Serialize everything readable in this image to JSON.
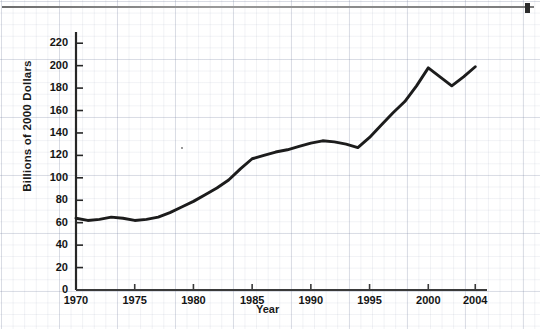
{
  "figure": {
    "ylabel": "Billions of 2000 Dollars",
    "xlabel": "Year",
    "source_note": "SOURCE: National Science Board, Science and Engineering Indicators—2004 (Arlington, VA: National Science Foundation, 2004), http://www.nsf.gov",
    "line_color": "#1c1c1c",
    "axis_color": "#262626",
    "grid_color": "#c9d0de",
    "background_color": "#ffffff"
  },
  "chart_data": {
    "type": "line",
    "title": "",
    "xlabel": "Year",
    "ylabel": "Billions of 2000 Dollars",
    "xlim": [
      1970,
      2005
    ],
    "ylim": [
      0,
      230
    ],
    "xticks": [
      1970,
      1975,
      1980,
      1985,
      1990,
      1995,
      2000,
      2004
    ],
    "xtick_labels": [
      "1970",
      "1975",
      "1980",
      "1985",
      "1990",
      "1995",
      "2000",
      "2004"
    ],
    "yticks": [
      0,
      20,
      40,
      60,
      80,
      100,
      120,
      140,
      160,
      180,
      200,
      220
    ],
    "ytick_labels": [
      "0",
      "20",
      "40",
      "60",
      "80",
      "100",
      "120",
      "140",
      "160",
      "180",
      "200",
      "220"
    ],
    "grid": false,
    "legend": null,
    "x": [
      1970,
      1971,
      1972,
      1973,
      1974,
      1975,
      1976,
      1977,
      1978,
      1979,
      1980,
      1981,
      1982,
      1983,
      1984,
      1985,
      1986,
      1987,
      1988,
      1989,
      1990,
      1991,
      1992,
      1993,
      1994,
      1995,
      1996,
      1997,
      1998,
      1999,
      2000,
      2001,
      2002,
      2003,
      2004
    ],
    "series": [
      {
        "name": "Federal R&D funding",
        "values": [
          64,
          62,
          63,
          65,
          64,
          62,
          63,
          65,
          69,
          74,
          79,
          85,
          91,
          98,
          108,
          117,
          120,
          123,
          125,
          128,
          131,
          133,
          132,
          130,
          127,
          136,
          147,
          158,
          168,
          182,
          198,
          190,
          182,
          190,
          199
        ]
      }
    ]
  }
}
